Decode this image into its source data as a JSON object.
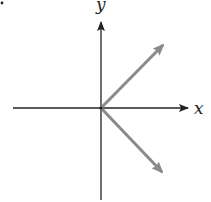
{
  "diagram": {
    "type": "vector-diagram",
    "axes": {
      "x": {
        "label": "x",
        "from": [
          13,
          108
        ],
        "to": [
          188,
          108
        ]
      },
      "y": {
        "label": "y",
        "from": [
          101,
          200
        ],
        "to": [
          101,
          22
        ]
      }
    },
    "origin": [
      101,
      108
    ],
    "vectors": [
      {
        "name": "upper-right-vector",
        "from": [
          101,
          108
        ],
        "to": [
          163,
          45
        ],
        "direction": "up-right"
      },
      {
        "name": "lower-right-vector",
        "from": [
          101,
          108
        ],
        "to": [
          162,
          172
        ],
        "direction": "down-right"
      }
    ],
    "colors": {
      "axis": "#222222",
      "vector": "#8a8a8a",
      "background": "#ffffff"
    }
  }
}
